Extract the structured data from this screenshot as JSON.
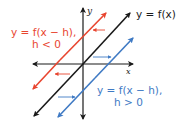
{
  "diagram": {
    "axes": {
      "x_label": "x",
      "y_label": "y"
    },
    "lines": [
      {
        "name": "parent",
        "label": "y = f(x)",
        "color": "#1a1a1a"
      },
      {
        "name": "shift-left",
        "label_line1": "y = f(x − h),",
        "label_line2": "h < 0",
        "color": "#e8452f"
      },
      {
        "name": "shift-right",
        "label_line1": "y = f(x − h),",
        "label_line2": "h > 0",
        "color": "#3f7ac4"
      }
    ],
    "colors": {
      "black": "#1a1a1a",
      "red": "#e8452f",
      "blue": "#3f7ac4"
    }
  }
}
